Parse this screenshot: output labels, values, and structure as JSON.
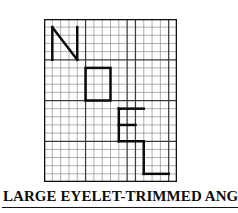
{
  "caption": {
    "text": "LARGE EYELET-TRIMMED ANGEL",
    "underlined": true,
    "color": "#0d0d0d"
  },
  "chart_data": {
    "type": "table",
    "title": "LARGE EYELET-TRIMMED ANGEL",
    "subtitle": "",
    "xlabel": "",
    "ylabel": "",
    "grid": true,
    "legend": "none",
    "columns": 16,
    "rows": 20,
    "cell_size_px": 8.3,
    "xlim": [
      0,
      16
    ],
    "ylim": [
      0,
      20
    ],
    "colors": {
      "background": "#ffffff",
      "border": "#111111",
      "grid_minor": "#8d8d8d",
      "grid_major": "#3b3b3b",
      "stitch": "#0b0b0b"
    },
    "line_widths": {
      "border": 2.6,
      "grid_minor": 0.7,
      "grid_major": 1.25,
      "stitch": 2.5
    },
    "major_every": 5,
    "major_columns": [
      5,
      10,
      11,
      15
    ],
    "major_rows": [
      5,
      10,
      15
    ],
    "letters": [
      {
        "char": "N",
        "col_start": 1,
        "col_end": 4,
        "row_start": 1,
        "row_end": 5,
        "strokes": [
          {
            "type": "line",
            "x1": 1,
            "y1": 1,
            "x2": 1,
            "y2": 5
          },
          {
            "type": "line",
            "x1": 1,
            "y1": 1,
            "x2": 4,
            "y2": 5
          },
          {
            "type": "line",
            "x1": 4,
            "y1": 1,
            "x2": 4,
            "y2": 5
          }
        ]
      },
      {
        "char": "O",
        "col_start": 5,
        "col_end": 8,
        "row_start": 6,
        "row_end": 10,
        "strokes": [
          {
            "type": "rect",
            "x": 5,
            "y": 6,
            "w": 3,
            "h": 4
          }
        ]
      },
      {
        "char": "E",
        "col_start": 9,
        "col_end": 12,
        "row_start": 11,
        "row_end": 15,
        "strokes": [
          {
            "type": "line",
            "x1": 9,
            "y1": 11,
            "x2": 9,
            "y2": 15
          },
          {
            "type": "line",
            "x1": 9,
            "y1": 11,
            "x2": 12,
            "y2": 11
          },
          {
            "type": "line",
            "x1": 9,
            "y1": 13,
            "x2": 11,
            "y2": 13
          },
          {
            "type": "line",
            "x1": 9,
            "y1": 15,
            "x2": 12,
            "y2": 15
          }
        ]
      },
      {
        "char": "L",
        "col_start": 12,
        "col_end": 15,
        "row_start": 15,
        "row_end": 19,
        "strokes": [
          {
            "type": "line",
            "x1": 12,
            "y1": 15,
            "x2": 12,
            "y2": 19
          },
          {
            "type": "line",
            "x1": 12,
            "y1": 19,
            "x2": 15,
            "y2": 19
          }
        ]
      }
    ],
    "word": "NOEL"
  }
}
